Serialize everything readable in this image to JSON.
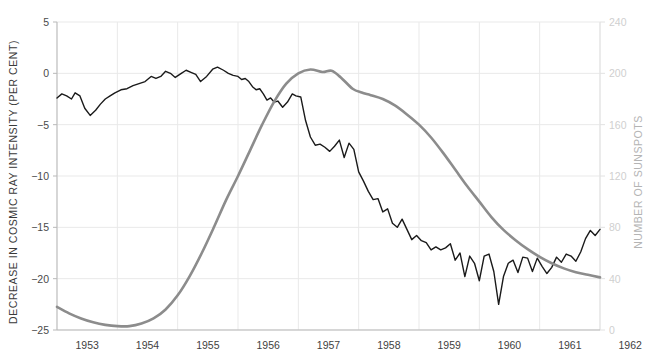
{
  "chart_data": {
    "type": "line",
    "title": "",
    "xlabel": "",
    "ylabel": "DECREASE IN COSMIC RAY INTENSITY (PER CENT)",
    "y2label": "NUMBER OF SUNSPOTS",
    "xlim": [
      1953.0,
      1962.0
    ],
    "ylim": [
      -25,
      5
    ],
    "y2lim": [
      0,
      240
    ],
    "grid": true,
    "legend": "none",
    "x_ticks": [
      1953,
      1954,
      1955,
      1956,
      1957,
      1958,
      1959,
      1960,
      1961,
      1962
    ],
    "x_tick_labels": [
      "1953",
      "1954",
      "1955",
      "1956",
      "1957",
      "1958",
      "1959",
      "1960",
      "1961",
      "1962"
    ],
    "y_ticks": [
      5,
      0,
      -5,
      -10,
      -15,
      -20,
      -25
    ],
    "y_tick_labels": [
      "5",
      "0",
      "−5",
      "−10",
      "−15",
      "−20",
      "−25"
    ],
    "y2_ticks": [
      240,
      200,
      160,
      120,
      80,
      40,
      0
    ],
    "y2_tick_labels": [
      "240",
      "200",
      "160",
      "120",
      "80",
      "40",
      "0"
    ],
    "colors": {
      "cosmic_ray": "#1a1a1a",
      "sunspots": "#8c8c8c",
      "grid": "#e9e9e9",
      "axis": "#b9b9b9"
    },
    "series": [
      {
        "name": "Decrease in cosmic ray intensity (per cent)",
        "axis": "left",
        "color": "#1a1a1a",
        "width": 1.4,
        "x": [
          1953.0,
          1953.08,
          1953.16,
          1953.24,
          1953.3,
          1953.38,
          1953.46,
          1953.55,
          1953.64,
          1953.72,
          1953.8,
          1953.88,
          1953.96,
          1954.06,
          1954.16,
          1954.26,
          1954.36,
          1954.46,
          1954.56,
          1954.64,
          1954.72,
          1954.8,
          1954.88,
          1954.96,
          1955.06,
          1955.14,
          1955.22,
          1955.3,
          1955.38,
          1955.48,
          1955.58,
          1955.66,
          1955.76,
          1955.84,
          1955.92,
          1956.0,
          1956.06,
          1956.12,
          1956.18,
          1956.24,
          1956.3,
          1956.36,
          1956.42,
          1956.48,
          1956.54,
          1956.6,
          1956.66,
          1956.74,
          1956.82,
          1956.9,
          1956.96,
          1957.04,
          1957.12,
          1957.2,
          1957.28,
          1957.36,
          1957.44,
          1957.52,
          1957.6,
          1957.68,
          1957.76,
          1957.84,
          1957.92,
          1958.0,
          1958.08,
          1958.16,
          1958.24,
          1958.32,
          1958.4,
          1958.48,
          1958.56,
          1958.64,
          1958.72,
          1958.8,
          1958.88,
          1958.96,
          1959.04,
          1959.12,
          1959.2,
          1959.28,
          1959.36,
          1959.44,
          1959.52,
          1959.6,
          1959.68,
          1959.76,
          1959.84,
          1959.92,
          1960.0,
          1960.08,
          1960.16,
          1960.24,
          1960.32,
          1960.4,
          1960.48,
          1960.56,
          1960.64,
          1960.72,
          1960.8,
          1960.88,
          1960.96,
          1961.04,
          1961.12,
          1961.2,
          1961.28,
          1961.36,
          1961.44,
          1961.52,
          1961.6,
          1961.68,
          1961.76,
          1961.84,
          1961.92,
          1962.0,
          1962.08,
          1962.16,
          1962.24,
          1962.32,
          1962.4,
          1962.46
        ],
        "y": [
          -2.4,
          -2.0,
          -2.2,
          -2.5,
          -1.9,
          -2.2,
          -3.4,
          -4.1,
          -3.6,
          -3.0,
          -2.5,
          -2.2,
          -1.9,
          -1.6,
          -1.5,
          -1.2,
          -1.0,
          -0.8,
          -0.3,
          -0.5,
          -0.3,
          0.2,
          0.0,
          -0.4,
          0.0,
          0.3,
          0.1,
          -0.1,
          -0.8,
          -0.3,
          0.4,
          0.6,
          0.3,
          0.0,
          -0.2,
          -0.3,
          -0.6,
          -0.5,
          -0.8,
          -1.3,
          -1.6,
          -1.5,
          -2.0,
          -2.6,
          -2.4,
          -2.8,
          -2.7,
          -3.3,
          -2.8,
          -2.0,
          -2.2,
          -2.3,
          -4.6,
          -6.2,
          -7.0,
          -6.9,
          -7.2,
          -7.6,
          -7.1,
          -6.5,
          -8.2,
          -6.8,
          -7.4,
          -9.6,
          -10.5,
          -11.5,
          -12.3,
          -12.2,
          -13.5,
          -13.2,
          -14.6,
          -15.0,
          -14.2,
          -15.2,
          -16.2,
          -15.8,
          -16.3,
          -16.5,
          -17.2,
          -16.9,
          -17.2,
          -17.0,
          -16.6,
          -18.2,
          -17.5,
          -19.8,
          -17.8,
          -18.5,
          -20.2,
          -17.8,
          -17.6,
          -19.3,
          -22.5,
          -19.8,
          -18.5,
          -18.2,
          -19.4,
          -17.9,
          -18.0,
          -19.3,
          -18.0,
          -18.8,
          -19.5,
          -18.9,
          -17.9,
          -18.4,
          -17.6,
          -17.8,
          -18.3,
          -17.4,
          -16.1,
          -15.3,
          -15.8,
          -15.2,
          -14.6,
          -15.0,
          -18.0,
          -16.2,
          -13.8,
          -12.0
        ]
      },
      {
        "name": "Number of sunspots",
        "axis": "right",
        "color": "#8c8c8c",
        "width": 2.6,
        "x": [
          1953.0,
          1953.2,
          1953.4,
          1953.6,
          1953.8,
          1954.0,
          1954.2,
          1954.4,
          1954.6,
          1954.8,
          1955.0,
          1955.2,
          1955.4,
          1955.6,
          1955.8,
          1956.0,
          1956.2,
          1956.4,
          1956.6,
          1956.8,
          1957.0,
          1957.2,
          1957.4,
          1957.55,
          1957.7,
          1957.9,
          1958.05,
          1958.2,
          1958.4,
          1958.6,
          1958.8,
          1959.0,
          1959.2,
          1959.4,
          1959.6,
          1959.8,
          1960.0,
          1960.2,
          1960.4,
          1960.6,
          1960.8,
          1961.0,
          1961.2,
          1961.4,
          1961.6,
          1961.8,
          1962.0,
          1962.2,
          1962.4,
          1962.6,
          1962.8,
          1963.0
        ],
        "y": [
          18,
          13,
          9,
          6,
          4,
          3,
          3,
          5,
          9,
          16,
          27,
          42,
          60,
          80,
          101,
          120,
          140,
          160,
          178,
          192,
          200,
          203,
          201,
          202,
          197,
          188,
          185,
          183,
          180,
          175,
          168,
          160,
          150,
          138,
          125,
          112,
          100,
          88,
          78,
          70,
          63,
          57,
          52,
          48,
          45,
          43,
          41,
          39,
          38,
          37,
          36,
          36
        ]
      }
    ]
  },
  "axes": {
    "left_title": "DECREASE IN COSMIC RAY INTENSITY (PER CENT)",
    "right_title": "NUMBER OF SUNSPOTS"
  }
}
